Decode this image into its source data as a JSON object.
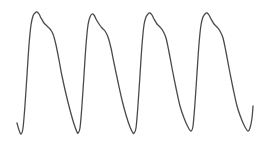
{
  "chart_data": {
    "type": "line",
    "title": "",
    "xlabel": "",
    "ylabel": "",
    "grid": false,
    "legend": null,
    "line_color": "#4a4a4a",
    "series": [
      {
        "name": "waveform",
        "points_px": [
          [
            17,
            123
          ],
          [
            19,
            130
          ],
          [
            21,
            134
          ],
          [
            23,
            128
          ],
          [
            25,
            105
          ],
          [
            27,
            75
          ],
          [
            29,
            45
          ],
          [
            31,
            25
          ],
          [
            33,
            16
          ],
          [
            35,
            13
          ],
          [
            37,
            12
          ],
          [
            39,
            14
          ],
          [
            41,
            18
          ],
          [
            44,
            23
          ],
          [
            47,
            26
          ],
          [
            50,
            29
          ],
          [
            53,
            34
          ],
          [
            56,
            45
          ],
          [
            59,
            60
          ],
          [
            62,
            76
          ],
          [
            66,
            94
          ],
          [
            70,
            110
          ],
          [
            74,
            124
          ],
          [
            77,
            132
          ],
          [
            78,
            133
          ],
          [
            80,
            128
          ],
          [
            82,
            105
          ],
          [
            84,
            75
          ],
          [
            86,
            45
          ],
          [
            88,
            25
          ],
          [
            90,
            17
          ],
          [
            92,
            14
          ],
          [
            94,
            15
          ],
          [
            96,
            19
          ],
          [
            99,
            24
          ],
          [
            102,
            28
          ],
          [
            105,
            31
          ],
          [
            108,
            37
          ],
          [
            111,
            48
          ],
          [
            114,
            63
          ],
          [
            118,
            82
          ],
          [
            122,
            100
          ],
          [
            126,
            115
          ],
          [
            130,
            127
          ],
          [
            133,
            133
          ],
          [
            134,
            133
          ],
          [
            136,
            128
          ],
          [
            138,
            105
          ],
          [
            140,
            75
          ],
          [
            142,
            45
          ],
          [
            144,
            25
          ],
          [
            146,
            17
          ],
          [
            148,
            14
          ],
          [
            150,
            13
          ],
          [
            152,
            15
          ],
          [
            154,
            19
          ],
          [
            157,
            24
          ],
          [
            160,
            27
          ],
          [
            163,
            31
          ],
          [
            166,
            38
          ],
          [
            169,
            52
          ],
          [
            172,
            68
          ],
          [
            176,
            88
          ],
          [
            180,
            106
          ],
          [
            184,
            118
          ],
          [
            188,
            127
          ],
          [
            191,
            131
          ],
          [
            193,
            126
          ],
          [
            195,
            103
          ],
          [
            197,
            73
          ],
          [
            199,
            44
          ],
          [
            201,
            25
          ],
          [
            203,
            17
          ],
          [
            205,
            14
          ],
          [
            207,
            13
          ],
          [
            209,
            15
          ],
          [
            211,
            19
          ],
          [
            214,
            24
          ],
          [
            217,
            27
          ],
          [
            220,
            31
          ],
          [
            223,
            38
          ],
          [
            226,
            52
          ],
          [
            229,
            68
          ],
          [
            233,
            88
          ],
          [
            237,
            106
          ],
          [
            241,
            118
          ],
          [
            245,
            127
          ],
          [
            248,
            131
          ],
          [
            250,
            128
          ],
          [
            252,
            118
          ],
          [
            253,
            106
          ]
        ]
      }
    ],
    "peaks_px": [
      [
        37,
        12
      ],
      [
        93,
        14
      ],
      [
        150,
        13
      ],
      [
        207,
        13
      ]
    ],
    "troughs_px": [
      [
        21,
        134
      ],
      [
        78,
        133
      ],
      [
        134,
        133
      ],
      [
        191,
        131
      ],
      [
        248,
        131
      ]
    ],
    "cycles": 4,
    "period_px": 57,
    "xlim_px": [
      0,
      269
    ],
    "ylim_px": [
      0,
      144
    ]
  }
}
